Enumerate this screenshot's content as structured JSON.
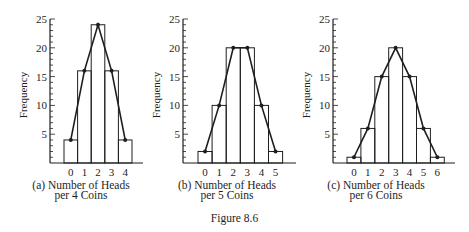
{
  "figure": {
    "label": "Figure 8.6"
  },
  "chart_data": [
    {
      "type": "bar",
      "overlay": "line",
      "panel": "(a)",
      "title": "(a) Number of Heads per 4 Coins",
      "caption_line1": "(a)  Number of Heads",
      "caption_line2": "per 4 Coins",
      "xlabel": "Number of Heads per 4 Coins",
      "ylabel": "Frequency",
      "categories": [
        "0",
        "1",
        "2",
        "3",
        "4"
      ],
      "values": [
        4,
        16,
        24,
        16,
        4
      ],
      "ylim": [
        0,
        25
      ],
      "yticks": [
        5,
        10,
        15,
        20,
        25
      ],
      "minor_ticks_every": 1,
      "grid": false,
      "legend": null
    },
    {
      "type": "bar",
      "overlay": "line",
      "panel": "(b)",
      "title": "(b) Number of Heads per 5 Coins",
      "caption_line1": "(b)  Number of Heads",
      "caption_line2": "per 5 Coins",
      "xlabel": "Number of Heads per 5 Coins",
      "ylabel": "Frequency",
      "categories": [
        "0",
        "1",
        "2",
        "3",
        "4",
        "5"
      ],
      "values": [
        2,
        10,
        20,
        20,
        10,
        2
      ],
      "ylim": [
        0,
        25
      ],
      "yticks": [
        5,
        10,
        15,
        20,
        25
      ],
      "minor_ticks_every": 1,
      "grid": false,
      "legend": null
    },
    {
      "type": "bar",
      "overlay": "line",
      "panel": "(c)",
      "title": "(c) Number of Heads per 6 Coins",
      "caption_line1": "(c)  Number of Heads",
      "caption_line2": "per 6 Coins",
      "xlabel": "Number of Heads per 6 Coins",
      "ylabel": "Frequency",
      "categories": [
        "0",
        "1",
        "2",
        "3",
        "4",
        "5",
        "6"
      ],
      "values": [
        1,
        6,
        15,
        20,
        15,
        6,
        1
      ],
      "ylim": [
        0,
        25
      ],
      "yticks": [
        5,
        10,
        15,
        20,
        25
      ],
      "minor_ticks_every": 1,
      "grid": false,
      "legend": null
    }
  ],
  "layout": {
    "panels": [
      {
        "axis_x": 50,
        "bar_start": 64,
        "bar_width": 13.6,
        "axis_end": 143,
        "ylabel_x": 27,
        "caption_center": 81
      },
      {
        "axis_x": 183,
        "bar_start": 198,
        "bar_width": 14.1,
        "axis_end": 296,
        "ylabel_x": 160,
        "caption_center": 227
      },
      {
        "axis_x": 333,
        "bar_start": 347,
        "bar_width": 13.9,
        "axis_end": 455,
        "ylabel_x": 310,
        "caption_center": 376
      }
    ],
    "y_top": 19,
    "y_base": 163,
    "colors": {
      "ink": "#1e1e1e",
      "background": "#ffffff"
    }
  }
}
